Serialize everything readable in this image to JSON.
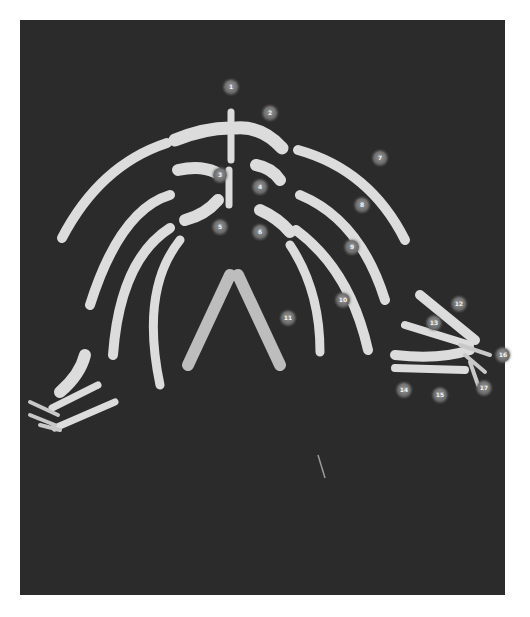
{
  "image": {
    "subject": "Skeletal specimen (ribs, sternum, forelimbs) on dark background with numbered markers",
    "background_color": "#2b2b2b",
    "bone_color": "#dcdcdc",
    "page_color": "#ffffff"
  },
  "markers": [
    {
      "label": "1",
      "x": 231,
      "y": 87
    },
    {
      "label": "2",
      "x": 270,
      "y": 113
    },
    {
      "label": "3",
      "x": 220,
      "y": 175
    },
    {
      "label": "4",
      "x": 260,
      "y": 187
    },
    {
      "label": "5",
      "x": 220,
      "y": 227
    },
    {
      "label": "6",
      "x": 260,
      "y": 232
    },
    {
      "label": "7",
      "x": 380,
      "y": 158
    },
    {
      "label": "8",
      "x": 362,
      "y": 205
    },
    {
      "label": "9",
      "x": 352,
      "y": 247
    },
    {
      "label": "10",
      "x": 343,
      "y": 300
    },
    {
      "label": "11",
      "x": 288,
      "y": 318
    },
    {
      "label": "12",
      "x": 459,
      "y": 304
    },
    {
      "label": "13",
      "x": 434,
      "y": 323
    },
    {
      "label": "14",
      "x": 404,
      "y": 390
    },
    {
      "label": "15",
      "x": 440,
      "y": 395
    },
    {
      "label": "16",
      "x": 503,
      "y": 355
    },
    {
      "label": "17",
      "x": 484,
      "y": 388
    }
  ]
}
